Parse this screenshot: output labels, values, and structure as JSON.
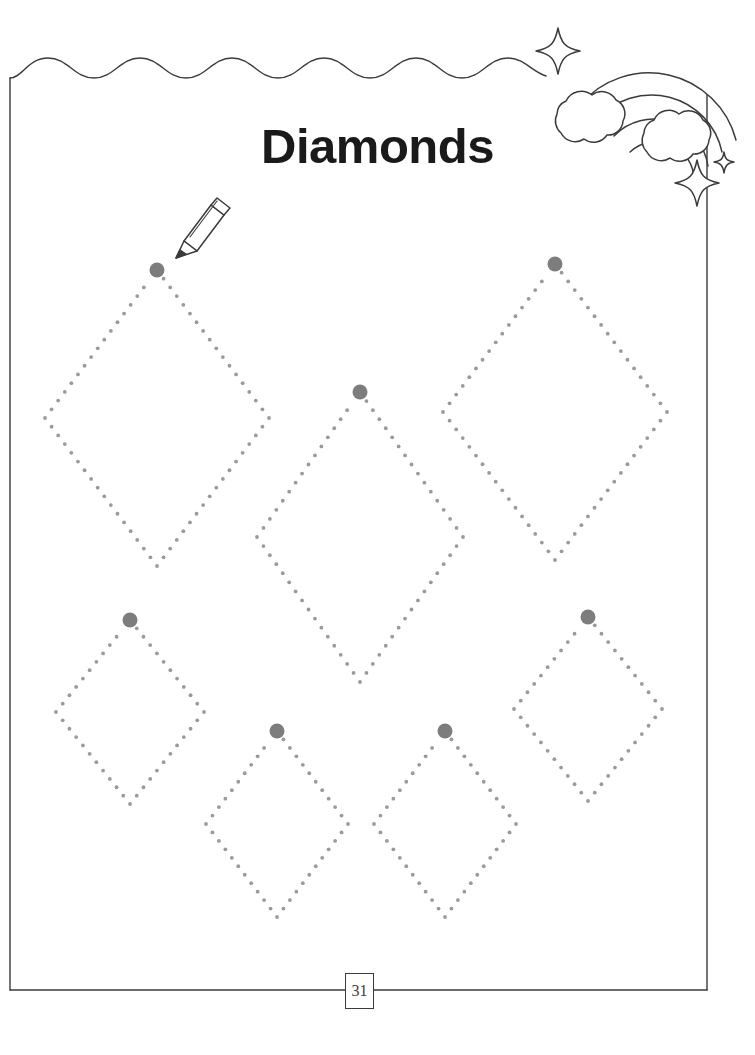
{
  "page": {
    "title": "Diamonds",
    "page_number": "31",
    "background_color": "#ffffff",
    "border_color": "#3b3b3b",
    "title_color": "#1a1a1a"
  },
  "decorations": {
    "rainbow": {
      "name": "rainbow-with-clouds",
      "arc_count": 4,
      "cloud_count": 2,
      "stroke_color": "#3b3b3b"
    },
    "sparkles": [
      {
        "name": "sparkle-star-top-left",
        "cx": 558,
        "cy": 50,
        "r": 22
      },
      {
        "name": "sparkle-star-bottom-large",
        "cx": 697,
        "cy": 182,
        "r": 22
      },
      {
        "name": "sparkle-star-bottom-small",
        "cx": 722,
        "cy": 163,
        "r": 11
      }
    ],
    "pencil": {
      "name": "pencil-icon",
      "tip_x": 166,
      "tip_y": 262,
      "stroke_color": "#3b3b3b"
    },
    "wavy_border": {
      "name": "wavy-top-border",
      "waves": 6,
      "amplitude": 12
    }
  },
  "tracing": {
    "dot_color": "#9a9a9a",
    "start_dot_color": "#7d7d7d",
    "dot_radius": 1.9,
    "start_dot_radius": 7.5,
    "dot_spacing": 11,
    "shapes": [
      {
        "name": "diamond-large-left",
        "cx": 157,
        "cy": 418,
        "half_w": 112,
        "half_h": 148
      },
      {
        "name": "diamond-large-right",
        "cx": 555,
        "cy": 412,
        "half_w": 112,
        "half_h": 148
      },
      {
        "name": "diamond-large-center",
        "cx": 360,
        "cy": 537,
        "half_w": 103,
        "half_h": 145
      },
      {
        "name": "diamond-small-left",
        "cx": 130,
        "cy": 712,
        "half_w": 74,
        "half_h": 92
      },
      {
        "name": "diamond-small-right",
        "cx": 588,
        "cy": 709,
        "half_w": 74,
        "half_h": 92
      },
      {
        "name": "diamond-small-mid1",
        "cx": 277,
        "cy": 824,
        "half_w": 71,
        "half_h": 93
      },
      {
        "name": "diamond-small-mid2",
        "cx": 445,
        "cy": 824,
        "half_w": 71,
        "half_h": 93
      }
    ]
  }
}
